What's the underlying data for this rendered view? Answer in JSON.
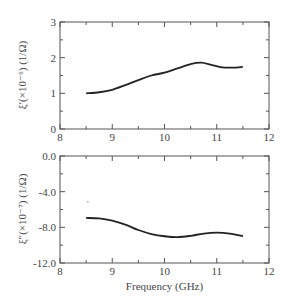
{
  "chart_data": [
    {
      "type": "line",
      "title": "",
      "xlabel": "",
      "ylabel": "ξ′(×10⁻⁶) (1/Ω)",
      "xlim": [
        8,
        12
      ],
      "ylim": [
        0,
        3
      ],
      "xticks": [
        "8",
        "9",
        "10",
        "11",
        "12"
      ],
      "yticks": [
        "0",
        "1",
        "2",
        "3"
      ],
      "grid": false,
      "series": [
        {
          "name": "xi_prime",
          "x": [
            8.5,
            8.75,
            9.0,
            9.25,
            9.5,
            9.75,
            10.0,
            10.25,
            10.5,
            10.7,
            10.9,
            11.1,
            11.3,
            11.5
          ],
          "y": [
            1.0,
            1.03,
            1.1,
            1.23,
            1.37,
            1.5,
            1.58,
            1.7,
            1.82,
            1.86,
            1.8,
            1.73,
            1.72,
            1.74
          ]
        }
      ]
    },
    {
      "type": "line",
      "title": "",
      "xlabel": "Frequency (GHz)",
      "ylabel": "ξ″(×10⁻⁷) (1/Ω)",
      "xlim": [
        8,
        12
      ],
      "ylim": [
        -12.0,
        0.0
      ],
      "xticks": [
        "8",
        "9",
        "10",
        "11",
        "12"
      ],
      "yticks": [
        "0.0",
        "-4.0",
        "-8.0",
        "-12.0"
      ],
      "grid": false,
      "series": [
        {
          "name": "xi_double_prime",
          "x": [
            8.5,
            8.75,
            9.0,
            9.25,
            9.5,
            9.75,
            10.0,
            10.25,
            10.5,
            10.75,
            11.0,
            11.25,
            11.5
          ],
          "y": [
            -6.95,
            -7.0,
            -7.25,
            -7.7,
            -8.3,
            -8.75,
            -9.0,
            -9.1,
            -8.95,
            -8.7,
            -8.6,
            -8.7,
            -9.0
          ]
        }
      ]
    }
  ]
}
